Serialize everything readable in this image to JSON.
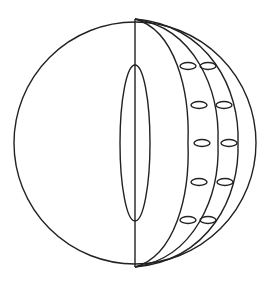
{
  "diagram": {
    "colors": {
      "stroke": "#222222",
      "background": "#ffffff"
    },
    "outer_circle": {
      "cx": 135,
      "cy": 143,
      "r": 121
    },
    "center_axis": {
      "x": 135,
      "y1": 19,
      "y2": 267
    },
    "core_ellipse": {
      "cx": 135,
      "cy": 143,
      "rx": 15,
      "ry": 78
    },
    "meridian_arcs": [
      {
        "name": "inner-arc",
        "mid_x": 188
      },
      {
        "name": "middle-arc",
        "mid_x": 218
      },
      {
        "name": "outer-arc",
        "mid_x": 238
      }
    ],
    "cells": [
      {
        "row": 1,
        "col": 1,
        "cx": 188,
        "cy": 66
      },
      {
        "row": 1,
        "col": 2,
        "cx": 208,
        "cy": 66
      },
      {
        "row": 2,
        "col": 1,
        "cx": 199,
        "cy": 105
      },
      {
        "row": 2,
        "col": 2,
        "cx": 224,
        "cy": 105
      },
      {
        "row": 3,
        "col": 1,
        "cx": 202,
        "cy": 143
      },
      {
        "row": 3,
        "col": 2,
        "cx": 229,
        "cy": 143
      },
      {
        "row": 4,
        "col": 1,
        "cx": 199,
        "cy": 182
      },
      {
        "row": 4,
        "col": 2,
        "cx": 225,
        "cy": 182
      },
      {
        "row": 5,
        "col": 1,
        "cx": 188,
        "cy": 220
      },
      {
        "row": 5,
        "col": 2,
        "cx": 208,
        "cy": 220
      }
    ],
    "cell_size": {
      "rx": 8,
      "ry": 3.5
    }
  }
}
